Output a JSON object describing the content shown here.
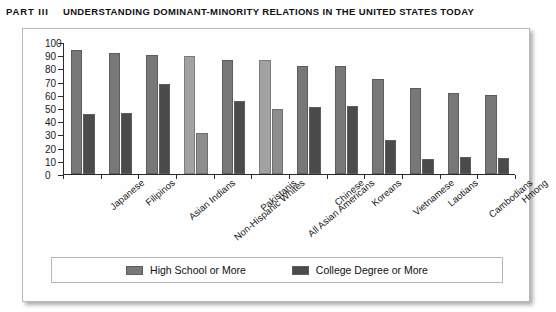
{
  "running_head": {
    "part": "PART III",
    "title": "UNDERSTANDING DOMINANT-MINORITY RELATIONS IN THE UNITED STATES TODAY"
  },
  "chart_data": {
    "type": "bar",
    "title": "",
    "xlabel": "",
    "ylabel": "",
    "ylim": [
      0,
      100
    ],
    "yticks": [
      0,
      10,
      20,
      30,
      40,
      50,
      60,
      70,
      80,
      90,
      100
    ],
    "grid": false,
    "legend_position": "bottom",
    "categories": [
      "Japanese",
      "Filipinos",
      "Asian Indians",
      "Non-Hispanic Whites",
      "Pakistanis",
      "All Asian Americans",
      "Chinese",
      "Koreans",
      "Vietnamese",
      "Laotians",
      "Cambodians",
      "Hmong"
    ],
    "series": [
      {
        "name": "High School or More",
        "color": "#787878",
        "values": [
          94,
          92,
          90.5,
          89.5,
          86.5,
          86,
          82,
          81.5,
          72,
          65.5,
          61,
          60
        ]
      },
      {
        "name": "College Degree or More",
        "color": "#4b4b4b",
        "values": [
          45.5,
          46,
          68.5,
          31,
          55,
          49,
          50.5,
          51.5,
          26,
          11.5,
          13,
          12.5
        ]
      }
    ],
    "highlight_categories": [
      "Non-Hispanic Whites",
      "All Asian Americans"
    ]
  },
  "legend": {
    "items": [
      {
        "label": "High School or More"
      },
      {
        "label": "College Degree or More"
      }
    ]
  }
}
